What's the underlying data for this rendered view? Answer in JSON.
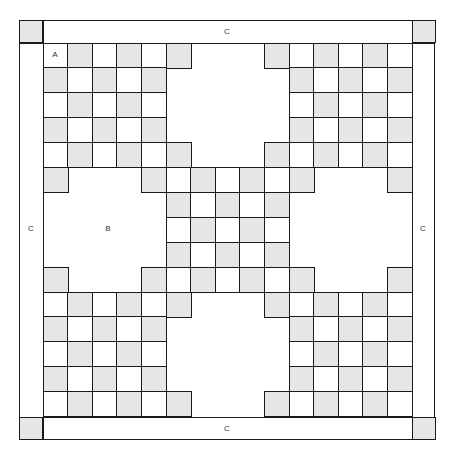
{
  "diagram": {
    "title": "",
    "labels": {
      "a": "A",
      "b": "B",
      "c_top": "C",
      "c_bottom": "C",
      "c_left": "C",
      "c_right": "C"
    },
    "colors": {
      "gray": "#e6e6e6",
      "white": "#ffffff",
      "line": "#1a1a1a"
    },
    "grid": {
      "size": 15,
      "color_rule": "gray when (row+col) is odd",
      "rows": [
        [
          0,
          1,
          2,
          3,
          4,
          5,
          9,
          10,
          11,
          12,
          13,
          14
        ],
        [
          0,
          1,
          2,
          3,
          4,
          10,
          11,
          12,
          13,
          14
        ],
        [
          0,
          1,
          2,
          3,
          4,
          10,
          11,
          12,
          13,
          14
        ],
        [
          0,
          1,
          2,
          3,
          4,
          10,
          11,
          12,
          13,
          14
        ],
        [
          0,
          1,
          2,
          3,
          4,
          5,
          9,
          10,
          11,
          12,
          13,
          14
        ],
        [
          0,
          4,
          5,
          6,
          7,
          8,
          9,
          10,
          14
        ],
        [
          5,
          6,
          7,
          8,
          9
        ],
        [
          5,
          6,
          7,
          8,
          9
        ],
        [
          5,
          6,
          7,
          8,
          9
        ],
        [
          0,
          4,
          5,
          6,
          7,
          8,
          9,
          10,
          14
        ],
        [
          0,
          1,
          2,
          3,
          4,
          5,
          9,
          10,
          11,
          12,
          13,
          14
        ],
        [
          0,
          1,
          2,
          3,
          4,
          10,
          11,
          12,
          13,
          14
        ],
        [
          0,
          1,
          2,
          3,
          4,
          10,
          11,
          12,
          13,
          14
        ],
        [
          0,
          1,
          2,
          3,
          4,
          10,
          11,
          12,
          13,
          14
        ],
        [
          0,
          1,
          2,
          3,
          4,
          5,
          9,
          10,
          11,
          12,
          13,
          14
        ]
      ]
    }
  }
}
